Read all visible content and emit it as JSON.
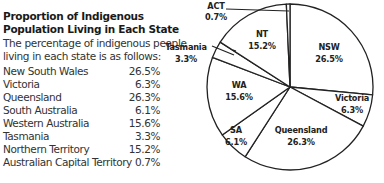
{
  "panel": {
    "title_line1": "Proportion of Indigenous",
    "title_line2": "Population Living in Each State",
    "intro_line1": "The percentage of indigenous people",
    "intro_line2": "living in each state is as follows:",
    "rows": [
      {
        "state": "New South Wales",
        "value": "26.5%"
      },
      {
        "state": "Victoria",
        "value": "6.3%"
      },
      {
        "state": "Queensland",
        "value": "26.3%"
      },
      {
        "state": "South Australia",
        "value": "6.1%"
      },
      {
        "state": "Western Australia",
        "value": "15.6%"
      },
      {
        "state": "Tasmania",
        "value": "3.3%"
      },
      {
        "state": "Northern Territory",
        "value": "15.2%"
      },
      {
        "state": "Australian Capital Territory",
        "value": "0.7%"
      }
    ]
  },
  "pie_labels": {
    "nsw": {
      "name": "NSW",
      "value": "26.5%"
    },
    "vic": {
      "name": "Victoria",
      "value": "6.3%"
    },
    "qld": {
      "name": "Queensland",
      "value": "26.3%"
    },
    "sa": {
      "name": "SA",
      "value": "6.1%"
    },
    "wa": {
      "name": "WA",
      "value": "15.6%"
    },
    "tas": {
      "name": "Tasmania",
      "value": "3.3%"
    },
    "nt": {
      "name": "NT",
      "value": "15.2%"
    },
    "act": {
      "name": "ACT",
      "value": "0.7%"
    }
  },
  "chart_data": {
    "type": "pie",
    "title": "Proportion of Indigenous Population Living in Each State",
    "categories": [
      "NSW",
      "Victoria",
      "Queensland",
      "SA",
      "WA",
      "Tasmania",
      "NT",
      "ACT"
    ],
    "values": [
      26.5,
      6.3,
      26.3,
      6.1,
      15.6,
      3.3,
      15.2,
      0.7
    ],
    "start_angle": "12 o'clock",
    "direction": "clockwise",
    "colors": {
      "fill": "#ffffff",
      "stroke": "#222222"
    },
    "legend": "none (slice labels inline / callouts for Tasmania and ACT)"
  }
}
